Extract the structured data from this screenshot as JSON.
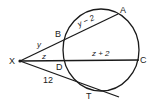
{
  "diagram": {
    "points": {
      "X": "X",
      "A": "A",
      "B": "B",
      "C": "C",
      "D": "D",
      "T": "T"
    },
    "segments": {
      "XB": "y",
      "BA": "y − 2",
      "XD": "z",
      "DC": "z + 2",
      "XT": "12"
    },
    "colors": {
      "stroke": "#1a1a1a",
      "background": "#ffffff"
    }
  }
}
